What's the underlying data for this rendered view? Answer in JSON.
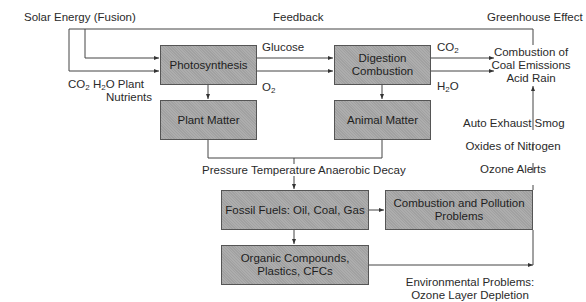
{
  "diagram": {
    "type": "flowchart",
    "colors": {
      "box_fill": "#a8a8a8",
      "box_border": "#555555",
      "line": "#444444",
      "text": "#2a2a2a"
    },
    "boxes": {
      "photosynthesis": "Photosynthesis",
      "digestion_line1": "Digestion",
      "digestion_line2": "Combustion",
      "plant_matter": "Plant Matter",
      "animal_matter": "Animal Matter",
      "fossil_fuels": "Fossil Fuels: Oil, Coal, Gas",
      "combustion_pollution_line1": "Combustion and Pollution",
      "combustion_pollution_line2": "Problems",
      "organic_line1": "Organic Compounds,",
      "organic_line2": "Plastics, CFCs"
    },
    "labels": {
      "solar_energy": "Solar Energy (Fusion)",
      "feedback": "Feedback",
      "greenhouse": "Greenhouse Effect",
      "inputs_co2": "CO",
      "inputs_co2_sub": "2",
      "inputs_h2o_pre": "H",
      "inputs_h2o_sub": "2",
      "inputs_h2o_post": "O Plant",
      "inputs_line2": "Nutrients",
      "glucose": "Glucose",
      "o2_pre": "O",
      "o2_sub": "2",
      "co2_pre": "CO",
      "co2_sub": "2",
      "h2o_pre": "H",
      "h2o_sub": "2",
      "h2o_post": "O",
      "emissions_line1": "Combustion of",
      "emissions_line2": "Coal Emissions",
      "emissions_line3": "Acid Rain",
      "auto_exhaust": "Auto Exhaust Smog",
      "oxides": "Oxides of Nitrogen",
      "ozone_alerts": "Ozone Alerts",
      "decay": "Pressure Temperature Anaerobic Decay",
      "env_line1": "Environmental Problems:",
      "env_line2": "Ozone Layer Depletion"
    },
    "edges": [
      {
        "from": "Solar Energy (Fusion)",
        "to": "Photosynthesis"
      },
      {
        "from": "CO2 H2O Plant Nutrients",
        "to": "Photosynthesis"
      },
      {
        "from": "Photosynthesis",
        "to": "Digestion Combustion",
        "label": "Glucose"
      },
      {
        "from": "Photosynthesis",
        "to": "Digestion Combustion",
        "label": "O2"
      },
      {
        "from": "Digestion Combustion",
        "to": "Combustion of Coal Emissions Acid Rain",
        "label": "CO2"
      },
      {
        "from": "Digestion Combustion",
        "to": "Combustion of Coal Emissions Acid Rain",
        "label": "H2O"
      },
      {
        "from": "Photosynthesis",
        "to": "Plant Matter"
      },
      {
        "from": "Digestion Combustion",
        "to": "Animal Matter"
      },
      {
        "from": "Plant Matter + Animal Matter",
        "to": "Fossil Fuels: Oil, Coal, Gas",
        "label": "Pressure Temperature Anaerobic Decay"
      },
      {
        "from": "Fossil Fuels: Oil, Coal, Gas",
        "to": "Combustion and Pollution Problems"
      },
      {
        "from": "Fossil Fuels: Oil, Coal, Gas",
        "to": "Organic Compounds, Plastics, CFCs"
      },
      {
        "from": "Organic Compounds, Plastics, CFCs",
        "to": "Combustion and Pollution Problems (right edge)",
        "label": "Environmental Problems: Ozone Layer Depletion"
      },
      {
        "from": "Combustion and Pollution Problems",
        "to": "Combustion of Coal Emissions Acid Rain",
        "label": "Ozone Alerts / Oxides of Nitrogen / Auto Exhaust Smog"
      },
      {
        "from": "Greenhouse Effect",
        "to": "Photosynthesis",
        "label": "Feedback"
      }
    ]
  }
}
